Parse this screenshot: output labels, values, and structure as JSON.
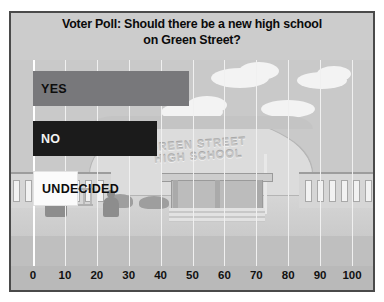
{
  "chart_data": {
    "type": "bar",
    "orientation": "horizontal",
    "title": "Voter Poll: Should there be a new high school\non Green Street?",
    "categories": [
      "YES",
      "NO",
      "UNDECIDED"
    ],
    "values": [
      49,
      39,
      14
    ],
    "xlabel": "",
    "ylabel": "",
    "xlim": [
      0,
      100
    ],
    "xticks": [
      "0",
      "10",
      "20",
      "30",
      "40",
      "50",
      "60",
      "70",
      "80",
      "90",
      "100"
    ],
    "grid": true,
    "legend": "none",
    "bar_colors": [
      "#78787b",
      "#1b1b1b",
      "#fbfbfb"
    ],
    "bar_label_colors": [
      "#0d0d0d",
      "#f2f2f2",
      "#0d0d0d"
    ]
  },
  "poster": {
    "title": "Voter Poll: Should there be a new high school\non Green Street?",
    "background_art": {
      "school_name": "GREEN STREET\nHIGH SCHOOL"
    }
  },
  "colors": {
    "frame_border": "#4a4a4a",
    "header_band": "#cccccc",
    "axis_band": "#b9b9b9",
    "gridline": "#f0f0f0"
  }
}
